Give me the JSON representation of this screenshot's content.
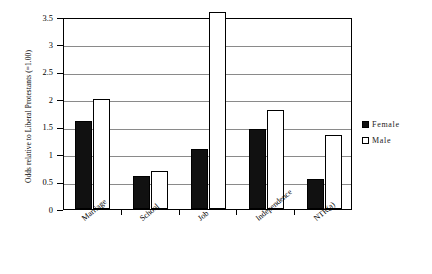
{
  "chart_data": {
    "type": "bar",
    "title": "",
    "xlabel": "",
    "ylabel": "Odds relative to Liberal Protestants (=1.00)",
    "ylim": [
      0,
      3.5
    ],
    "yticks": [
      "0",
      "0.5",
      "1",
      "1.5",
      "2",
      "2.5",
      "3",
      "3.5"
    ],
    "ytick_values": [
      0,
      0.5,
      1,
      1.5,
      2,
      2.5,
      3,
      3.5
    ],
    "grid": "horizontal",
    "legend_position": "right",
    "categories": [
      "Marriage",
      "School",
      "Job",
      "Independence",
      "NTR(a)"
    ],
    "series": [
      {
        "name": "Female",
        "color": "#111111",
        "values": [
          1.6,
          0.6,
          1.1,
          1.45,
          0.55
        ]
      },
      {
        "name": "Male",
        "color": "#ffffff",
        "values": [
          2.0,
          0.7,
          3.6,
          1.8,
          1.35
        ]
      }
    ]
  },
  "legend": {
    "items": [
      {
        "label": "Female"
      },
      {
        "label": "Male"
      }
    ]
  },
  "colors": {
    "female_fill": "#111111",
    "male_fill": "#ffffff",
    "axis": "#000000",
    "gridline": "#8a8a8a",
    "background": "#ffffff"
  }
}
